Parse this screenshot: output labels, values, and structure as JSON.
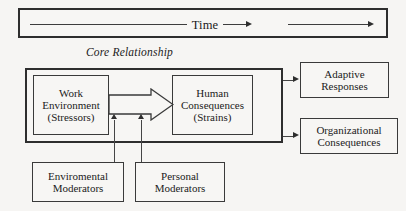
{
  "diagram": {
    "background_color": "#f6f5f3",
    "line_color": "#3a3a3a",
    "time_band": {
      "label": "Time",
      "arrow_count": 2
    },
    "core_caption": "Core Relationship",
    "core_box": {
      "nodes": [
        {
          "id": "work-environment",
          "label": "Work\nEnvironment\n(Stressors)"
        },
        {
          "id": "human-consequences",
          "label": "Human\nConsequences\n(Strains)"
        }
      ],
      "connector": "block-arrow"
    },
    "outcomes": [
      {
        "id": "adaptive-responses",
        "label": "Adaptive\nResponses"
      },
      {
        "id": "organizational-consequences",
        "label": "Organizational\nConsequences"
      }
    ],
    "moderators": [
      {
        "id": "environmental-moderators",
        "label": "Enviromental\nModerators"
      },
      {
        "id": "personal-moderators",
        "label": "Personal\nModerators"
      }
    ]
  }
}
